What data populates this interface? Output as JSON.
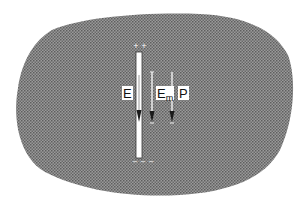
{
  "figure": {
    "colors": {
      "background": "#ffffff",
      "dielectric_fill": "#8c8c8c",
      "dielectric_dots": "#5a5a5a",
      "cavity_fill": "#ffffff",
      "arrow_line": "#f2f2f2",
      "arrowhead": "#1a1a1a",
      "label_text": "#111111"
    },
    "cavity": {
      "shape": "slot",
      "orientation": "vertical",
      "top_charge": "+ +",
      "bottom_charge": "− − −"
    },
    "vectors": [
      {
        "id": "E",
        "label": "E",
        "subscript": "",
        "direction": "down",
        "location": "inside-cavity"
      },
      {
        "id": "Em",
        "label": "E",
        "subscript": "m",
        "direction": "down",
        "location": "dielectric"
      },
      {
        "id": "P",
        "label": "P",
        "subscript": "",
        "direction": "down",
        "location": "dielectric"
      }
    ]
  }
}
